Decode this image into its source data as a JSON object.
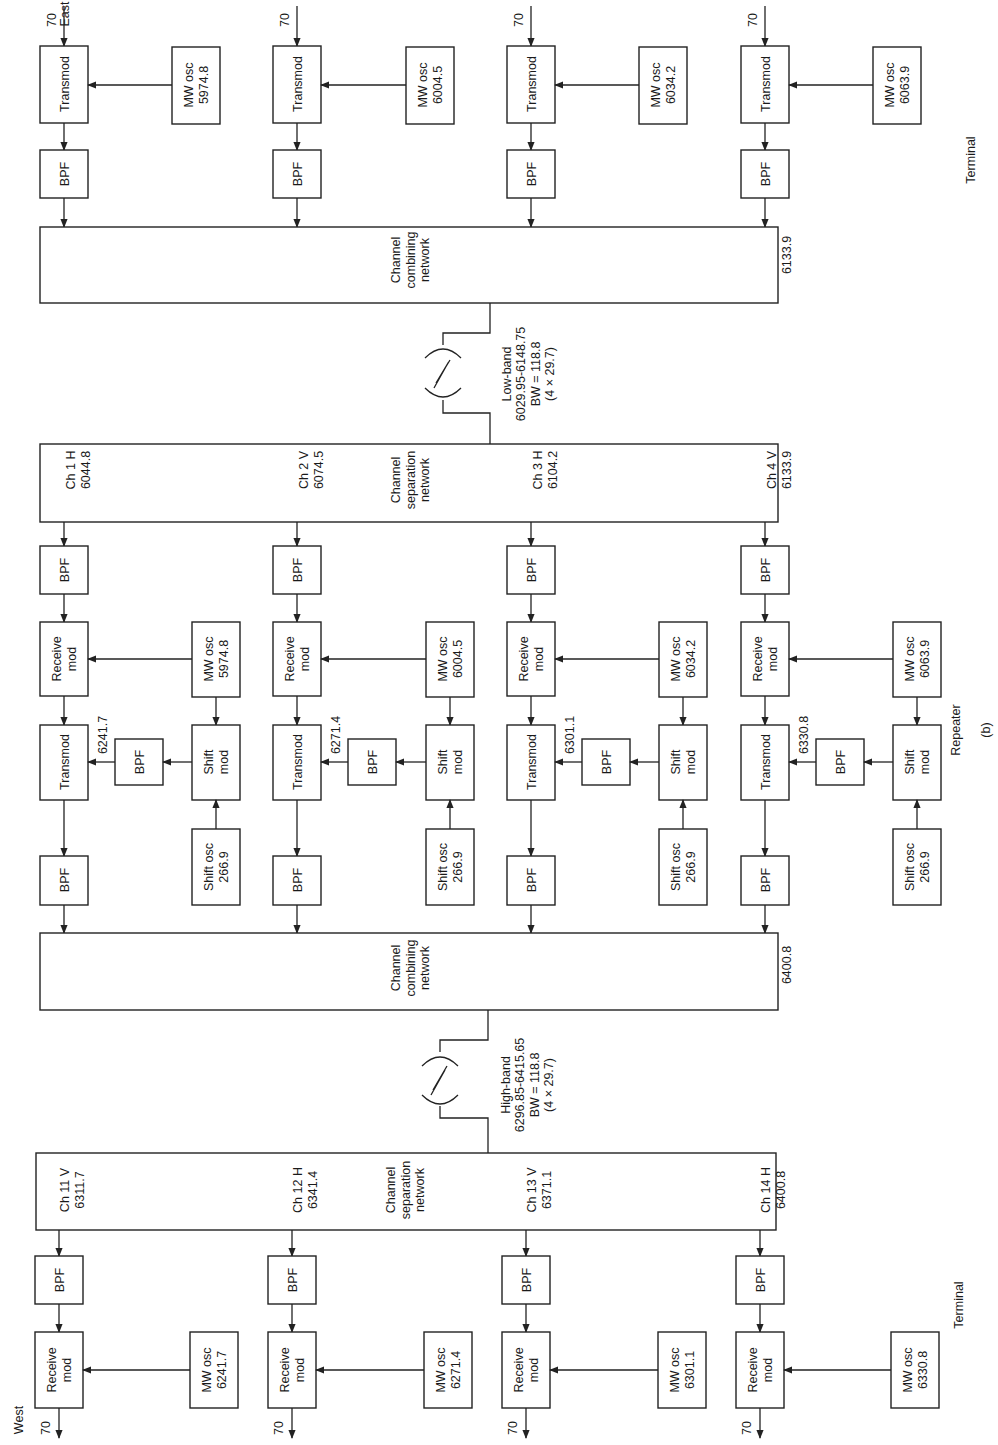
{
  "labels": {
    "east": "East",
    "west": "West",
    "terminal_top": "Terminal",
    "repeater": "Repeater",
    "terminal_bottom": "Terminal",
    "figure": "(b)",
    "input_70": "70",
    "transmod": "Transmod",
    "bpf": "BPF",
    "mw_osc": "MW osc",
    "receive": "Receive",
    "mod": "mod",
    "shift": "Shift",
    "shift_osc": "Shift osc",
    "channel": "Channel",
    "combining": "combining",
    "separation": "separation",
    "network": "network"
  },
  "east_terminal": {
    "mw_osc": [
      "5974.8",
      "6004.5",
      "6034.2",
      "6063.9"
    ],
    "channels": [
      {
        "name": "Ch 1 H",
        "freq": "6044.8"
      },
      {
        "name": "Ch 2 V",
        "freq": "6074.5"
      },
      {
        "name": "Ch 3 H",
        "freq": "6104.2"
      },
      {
        "name": "Ch 4 V",
        "freq": "6133.9"
      }
    ]
  },
  "low_band": {
    "title": "Low-band",
    "range": "6029.95-6148.75",
    "bw": "BW = 118.8",
    "calc": "(4 × 29.7)"
  },
  "repeater": {
    "separation_channels": [
      {
        "name": "Ch 1 H",
        "freq": "6044.8"
      },
      {
        "name": "Ch 2 V",
        "freq": "6074.5"
      },
      {
        "name": "Ch 3 H",
        "freq": "6104.2"
      },
      {
        "name": "Ch 4 V",
        "freq": "6133.9"
      }
    ],
    "mw_osc": [
      "5974.8",
      "6004.5",
      "6034.2",
      "6063.9"
    ],
    "shifted": [
      "6241.7",
      "6271.4",
      "6301.1",
      "6330.8"
    ],
    "shift_osc": [
      "266.9",
      "266.9",
      "266.9",
      "266.9"
    ],
    "combining_channels": [
      {
        "name": "Ch 11 V",
        "freq": "6311.7"
      },
      {
        "name": "Ch 12 H",
        "freq": "6341.4"
      },
      {
        "name": "Ch 13 V",
        "freq": "6371.1"
      },
      {
        "name": "Ch 14 H",
        "freq": "6400.8"
      }
    ]
  },
  "high_band": {
    "title": "High-band",
    "range": "6296.85-6415.65",
    "bw": "BW = 118.8",
    "calc": "(4 × 29.7)"
  },
  "west_terminal": {
    "channels": [
      {
        "name": "Ch 11 V",
        "freq": "6311.7"
      },
      {
        "name": "Ch 12 H",
        "freq": "6341.4"
      },
      {
        "name": "Ch 13 V",
        "freq": "6371.1"
      },
      {
        "name": "Ch 14 H",
        "freq": "6400.8"
      }
    ],
    "mw_osc": [
      "6241.7",
      "6271.4",
      "6301.1",
      "6330.8"
    ]
  }
}
